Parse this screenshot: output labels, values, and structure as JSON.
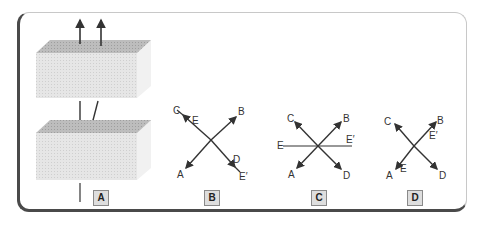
{
  "panels": [
    {
      "id": "A",
      "label": "A"
    },
    {
      "id": "B",
      "label": "B",
      "ends": {
        "upper_left": "C",
        "upper_left_inner": "E",
        "upper_right": "B",
        "lower_left": "A",
        "lower_right_inner": "D",
        "lower_right": "E′"
      }
    },
    {
      "id": "C",
      "label": "C",
      "ends": {
        "upper_left": "C",
        "upper_right": "B",
        "left": "E",
        "right": "E′",
        "lower_left": "A",
        "lower_right": "D"
      }
    },
    {
      "id": "D",
      "label": "D",
      "ends": {
        "upper_left": "C",
        "upper_right": "B",
        "upper_right_inner": "E′",
        "lower_left": "A",
        "lower_left_inner": "E",
        "lower_right": "D"
      }
    }
  ],
  "colors": {
    "block_face": "#e4e4e4",
    "block_top": "#b9b9b9",
    "block_side": "#f0f0f0",
    "line": "#333333",
    "frame_dark": "#4a4a4a",
    "frame_light": "#c8c8c8"
  }
}
